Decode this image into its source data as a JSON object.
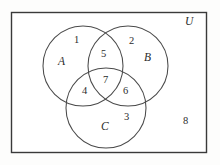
{
  "diagram": {
    "type": "venn-3-set",
    "title": "",
    "universe": {
      "label": "U",
      "rect": {
        "x": 11,
        "y": 12,
        "width": 196,
        "height": 141
      },
      "stroke": "#3a3a3a",
      "fill": "#ffffff"
    },
    "sets": [
      {
        "name": "A",
        "label": "A",
        "cx": 83,
        "cy": 66,
        "r": 40,
        "label_x": 58,
        "label_y": 56
      },
      {
        "name": "B",
        "label": "B",
        "cx": 128,
        "cy": 66,
        "r": 40,
        "label_x": 144,
        "label_y": 52
      },
      {
        "name": "C",
        "label": "C",
        "cx": 106,
        "cy": 108,
        "r": 40,
        "label_x": 101,
        "label_y": 121
      }
    ],
    "stroke_color": "#4a4a4a",
    "regions": [
      {
        "id": "r1",
        "label": "1",
        "description": "A only",
        "x": 74,
        "y": 35
      },
      {
        "id": "r2",
        "label": "2",
        "description": "B only",
        "x": 129,
        "y": 36
      },
      {
        "id": "r3",
        "label": "3",
        "description": "C only",
        "x": 124,
        "y": 112
      },
      {
        "id": "r4",
        "label": "4",
        "description": "A and C only",
        "x": 82,
        "y": 86
      },
      {
        "id": "r5",
        "label": "5",
        "description": "A and B only",
        "x": 101,
        "y": 49
      },
      {
        "id": "r6",
        "label": "6",
        "description": "B and C only",
        "x": 123,
        "y": 86
      },
      {
        "id": "r7",
        "label": "7",
        "description": "A and B and C",
        "x": 103,
        "y": 75
      },
      {
        "id": "r8",
        "label": "8",
        "description": "outside all sets",
        "x": 183,
        "y": 116
      }
    ]
  }
}
